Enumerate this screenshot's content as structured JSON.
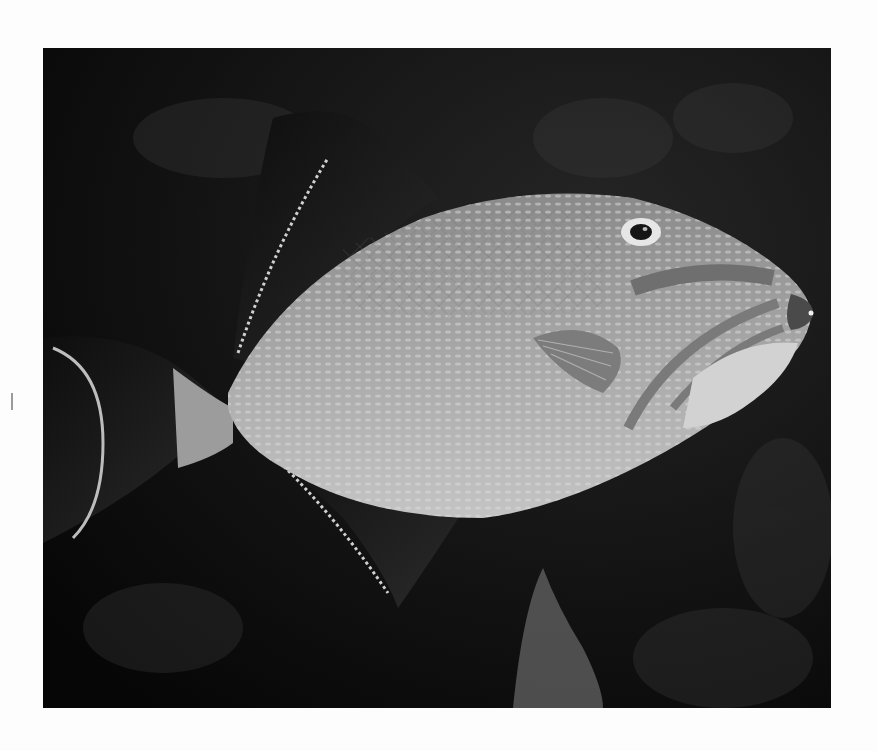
{
  "photo": {
    "subject": "Triggerfish in profile swimming left to right over dark reef background",
    "alt": "Grayscale photograph of a triggerfish",
    "colors": {
      "page_background": "#fdfdfd",
      "photo_background": "#0a0a0a",
      "fish_body": "#9a9a9a",
      "fin_dark": "#1c1c1c",
      "highlight": "#d8d8d8"
    }
  }
}
